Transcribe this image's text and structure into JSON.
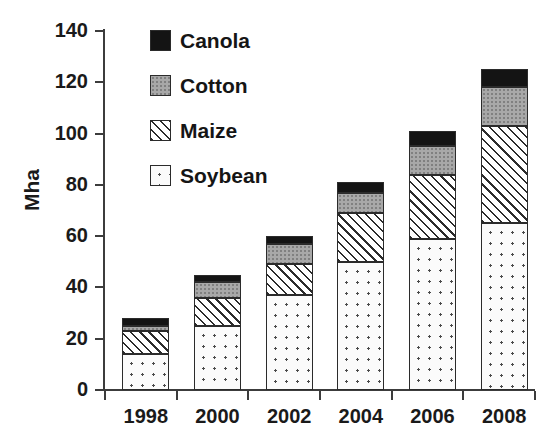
{
  "chart_data": {
    "type": "bar",
    "stacked": true,
    "title": "",
    "xlabel": "",
    "ylabel": "Mha",
    "categories": [
      "1998",
      "2000",
      "2002",
      "2004",
      "2006",
      "2008"
    ],
    "ylim": [
      0,
      140
    ],
    "yticks": [
      0,
      20,
      40,
      60,
      80,
      100,
      120,
      140
    ],
    "ytick_labels": [
      "0",
      "20",
      "40",
      "60",
      "80",
      "100",
      "120",
      "140"
    ],
    "grid": false,
    "legend_position": "upper left",
    "series": [
      {
        "name": "Soybean",
        "pattern": "dotted",
        "color": "#fbfbfb",
        "values": [
          14,
          25,
          37,
          50,
          59,
          65
        ]
      },
      {
        "name": "Maize",
        "pattern": "diagonal-hatch",
        "color": "#ffffff",
        "values": [
          9,
          11,
          12,
          19,
          25,
          38
        ]
      },
      {
        "name": "Cotton",
        "pattern": "fine-dot-grey",
        "color": "#a8a8a8",
        "values": [
          2,
          6,
          8,
          8,
          11,
          15
        ]
      },
      {
        "name": "Canola",
        "pattern": "solid-black",
        "color": "#141414",
        "values": [
          3,
          3,
          3,
          4,
          6,
          7
        ]
      }
    ],
    "stack_tops": {
      "Soybean": [
        14,
        25,
        37,
        50,
        59,
        65
      ],
      "Maize": [
        23,
        36,
        49,
        69,
        84,
        103
      ],
      "Cotton": [
        25,
        42,
        57,
        77,
        95,
        118
      ],
      "Canola": [
        28,
        45,
        60,
        81,
        101,
        125
      ]
    },
    "totals": [
      28,
      45,
      60,
      81,
      101,
      125
    ]
  },
  "legend": {
    "items": [
      {
        "label": "Canola",
        "swatch": "solid-black-swatch"
      },
      {
        "label": "Cotton",
        "swatch": "grey-dotted-swatch"
      },
      {
        "label": "Maize",
        "swatch": "hatched-swatch"
      },
      {
        "label": "Soybean",
        "swatch": "white-dotted-swatch"
      }
    ]
  },
  "axes": {
    "y_axis_label": "Mha"
  }
}
